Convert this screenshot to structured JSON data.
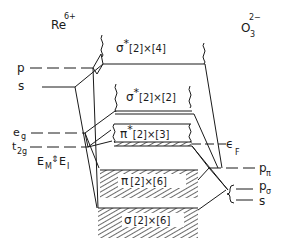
{
  "figure": {
    "type": "energy-band-diagram",
    "left_species": {
      "base": "Re",
      "charge": "6+"
    },
    "right_species": {
      "base": "O",
      "subscript": "3",
      "charge": "2−"
    }
  },
  "left_levels": {
    "p": "p",
    "s": "s",
    "eg": {
      "base": "e",
      "sub": "g"
    },
    "t2g": {
      "base": "t",
      "sub": "2g"
    },
    "em_ei": {
      "em_base": "E",
      "em_sub": "M",
      "ei_base": "E",
      "ei_sub": "I",
      "arrows": "⇕"
    }
  },
  "right_levels": {
    "p_pi": {
      "base": "p",
      "sub": "π"
    },
    "p_sigma": {
      "base": "p",
      "sub": "σ"
    },
    "s": "s",
    "fermi": {
      "base": "ϵ",
      "sub": "F"
    }
  },
  "bands": [
    {
      "id": "sigma-star-top",
      "symbol": "σ",
      "star": "*",
      "degeneracy": "[2]×[4]",
      "filled": false
    },
    {
      "id": "sigma-star-mid",
      "symbol": "σ",
      "star": "*",
      "degeneracy": "[2]×[2]",
      "filled": false
    },
    {
      "id": "pi-star",
      "symbol": "π",
      "star": "*",
      "degeneracy": "[2]×[3]",
      "filled": "partial"
    },
    {
      "id": "pi",
      "symbol": "π",
      "star": "",
      "degeneracy": "[2]×[6]",
      "filled": true
    },
    {
      "id": "sigma",
      "symbol": "σ",
      "star": "",
      "degeneracy": "[2]×[6]",
      "filled": true
    }
  ],
  "colors": {
    "ink": "#1a1a1a",
    "background": "#ffffff"
  }
}
